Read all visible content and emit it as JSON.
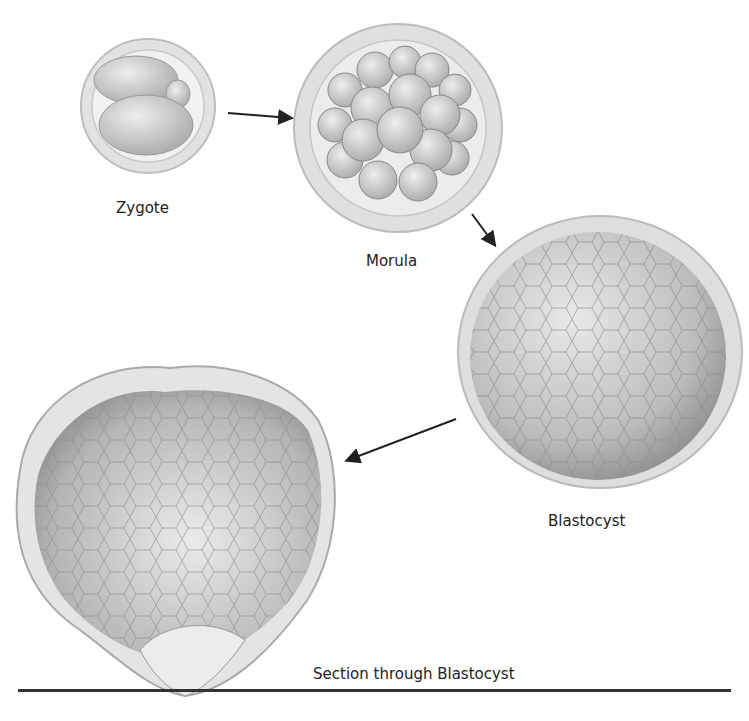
{
  "diagram": {
    "stages": [
      {
        "id": "zygote",
        "label": "Zygote"
      },
      {
        "id": "morula",
        "label": "Morula"
      },
      {
        "id": "blastocyst",
        "label": "Blastocyst"
      },
      {
        "id": "section",
        "label": "Section through Blastocyst"
      }
    ],
    "arrows": [
      {
        "from": "zygote",
        "to": "morula"
      },
      {
        "from": "morula",
        "to": "blastocyst"
      },
      {
        "from": "blastocyst",
        "to": "section"
      }
    ],
    "colors": {
      "membrane": "#d8d8d8",
      "cell": "#c8c8c8",
      "line": "#222222"
    }
  }
}
